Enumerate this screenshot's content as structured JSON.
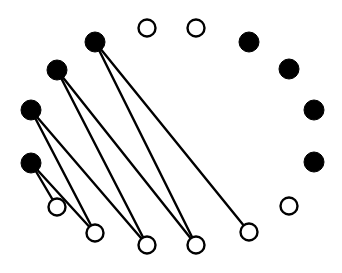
{
  "diagram": {
    "type": "graph",
    "colors": {
      "stroke": "#000000",
      "filled": "#000000",
      "open_fill": "#ffffff",
      "background": "#ffffff"
    },
    "node_radius": 9,
    "nodes": [
      {
        "id": "f1",
        "x": 95,
        "y": 42,
        "filled": true
      },
      {
        "id": "f2",
        "x": 57,
        "y": 70,
        "filled": true
      },
      {
        "id": "f3",
        "x": 31,
        "y": 110,
        "filled": true
      },
      {
        "id": "f4",
        "x": 31,
        "y": 163,
        "filled": true
      },
      {
        "id": "o1",
        "x": 57,
        "y": 207,
        "filled": false
      },
      {
        "id": "o2",
        "x": 95,
        "y": 233,
        "filled": false
      },
      {
        "id": "o3",
        "x": 147,
        "y": 245,
        "filled": false
      },
      {
        "id": "o4",
        "x": 196,
        "y": 245,
        "filled": false
      },
      {
        "id": "o5",
        "x": 249,
        "y": 232,
        "filled": false
      },
      {
        "id": "o6",
        "x": 289,
        "y": 206,
        "filled": false
      },
      {
        "id": "f5",
        "x": 314,
        "y": 162,
        "filled": true
      },
      {
        "id": "f6",
        "x": 314,
        "y": 110,
        "filled": true
      },
      {
        "id": "f7",
        "x": 289,
        "y": 69,
        "filled": true
      },
      {
        "id": "f8",
        "x": 249,
        "y": 42,
        "filled": true
      },
      {
        "id": "o7",
        "x": 196,
        "y": 28,
        "filled": false
      },
      {
        "id": "o8",
        "x": 147,
        "y": 28,
        "filled": false
      }
    ],
    "edges": [
      {
        "from": "f4",
        "to": "o1"
      },
      {
        "from": "f4",
        "to": "o2"
      },
      {
        "from": "f3",
        "to": "o2"
      },
      {
        "from": "f3",
        "to": "o3"
      },
      {
        "from": "f2",
        "to": "o3"
      },
      {
        "from": "f2",
        "to": "o4"
      },
      {
        "from": "f1",
        "to": "o4"
      },
      {
        "from": "f1",
        "to": "o5"
      }
    ]
  }
}
